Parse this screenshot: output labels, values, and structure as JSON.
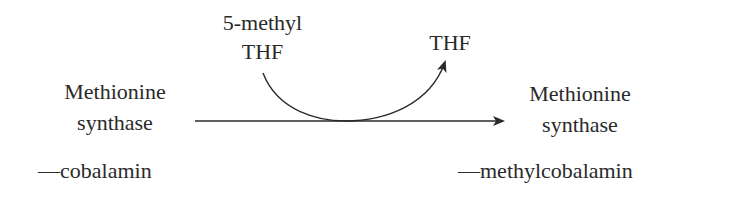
{
  "diagram": {
    "type": "reaction-scheme",
    "reactant": {
      "line1": "Methionine",
      "line2": "synthase",
      "cofactor": "—cobalamin"
    },
    "product": {
      "line1": "Methionine",
      "line2": "synthase",
      "cofactor": "—methylcobalamin"
    },
    "cosubstrate_in": {
      "line1": "5-methyl",
      "line2": "THF"
    },
    "cosubstrate_out": {
      "label": "THF"
    },
    "colors": {
      "text": "#2a2a2a",
      "arrow": "#2a2a2a",
      "background": "#ffffff"
    }
  }
}
